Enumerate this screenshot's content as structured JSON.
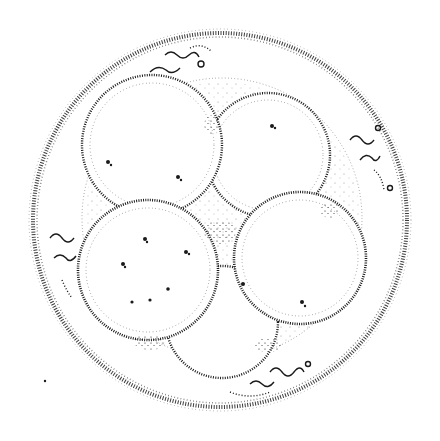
{
  "figure": {
    "subject": "Four-cell embryo within zona pellucida (stippled illustration)",
    "colors": {
      "ink": "#1a1a1a",
      "background": "#ffffff"
    },
    "zona": {
      "cx": 220,
      "cy": 220,
      "r": 187
    },
    "inner_membrane": {
      "cx": 222,
      "cy": 218,
      "r": 140
    },
    "cells": [
      {
        "id": "top-left",
        "cx": 152,
        "cy": 145,
        "r": 70
      },
      {
        "id": "top-right",
        "cx": 268,
        "cy": 155,
        "r": 62
      },
      {
        "id": "bottom-left",
        "cx": 148,
        "cy": 270,
        "r": 70
      },
      {
        "id": "bottom-right",
        "cx": 300,
        "cy": 258,
        "r": 66
      },
      {
        "id": "bottom-center",
        "cx": 222,
        "cy": 322,
        "r": 56
      }
    ],
    "polar_bodies": [
      {
        "id": "top",
        "x": 178,
        "y": 62
      },
      {
        "id": "right",
        "x": 368,
        "y": 150
      },
      {
        "id": "left",
        "x": 62,
        "y": 248
      },
      {
        "id": "bottom",
        "x": 285,
        "y": 372
      }
    ],
    "nuclei": [
      {
        "x": 108,
        "y": 162
      },
      {
        "x": 178,
        "y": 177
      },
      {
        "x": 272,
        "y": 126
      },
      {
        "x": 145,
        "y": 239
      },
      {
        "x": 186,
        "y": 252
      },
      {
        "x": 123,
        "y": 264
      },
      {
        "x": 168,
        "y": 289
      },
      {
        "x": 132,
        "y": 302
      },
      {
        "x": 150,
        "y": 300
      },
      {
        "x": 302,
        "y": 302
      },
      {
        "x": 243,
        "y": 284
      }
    ]
  }
}
